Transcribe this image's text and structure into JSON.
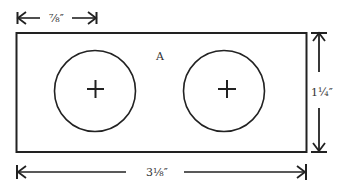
{
  "diagram": {
    "type": "technical-drawing",
    "plate": {
      "label": "A",
      "outline_color": "#222222"
    },
    "holes": [
      {
        "id": "left-hole",
        "center_mark": "+"
      },
      {
        "id": "right-hole",
        "center_mark": "+"
      }
    ],
    "dimensions": {
      "hole_offset": "⅞″",
      "height": "1¼″",
      "width": "3⅛″"
    },
    "colors": {
      "line": "#222222",
      "background": "#ffffff"
    }
  }
}
